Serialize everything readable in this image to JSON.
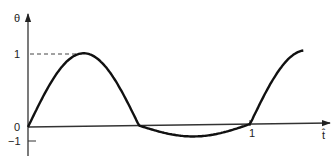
{
  "chart_data": {
    "type": "line",
    "title": "",
    "xlabel": "t̂",
    "ylabel": "θ",
    "x_ticks": [
      {
        "value": 1,
        "label": "1"
      }
    ],
    "y_ticks": [
      {
        "value": 1,
        "label": "1"
      },
      {
        "value": 0,
        "label": "0"
      },
      {
        "value": -1,
        "label": "−1"
      }
    ],
    "xlim": [
      0,
      1.2
    ],
    "ylim": [
      -1,
      1
    ],
    "grid": false,
    "legend": null,
    "annotations": [
      {
        "type": "dashed-reference-line",
        "y": 1,
        "from_x": 0,
        "to_x": 0.25
      }
    ],
    "series": [
      {
        "name": "theta",
        "function": "sin(2*pi*t)",
        "x": [
          0,
          0.05,
          0.1,
          0.15,
          0.2,
          0.25,
          0.3,
          0.35,
          0.4,
          0.45,
          0.5,
          0.55,
          0.6,
          0.65,
          0.7,
          0.75,
          0.8,
          0.85,
          0.9,
          0.95,
          1.0,
          1.05,
          1.1,
          1.15,
          1.2
        ],
        "values": [
          0,
          0.31,
          0.59,
          0.81,
          0.95,
          1.0,
          0.95,
          0.81,
          0.59,
          0.31,
          0,
          -0.31,
          -0.59,
          -0.81,
          -0.95,
          -1.0,
          -0.95,
          -0.81,
          -0.59,
          -0.31,
          0,
          0.31,
          0.59,
          0.81,
          0.95
        ]
      }
    ]
  },
  "labels": {
    "y_axis": "θ",
    "x_axis": "t̂",
    "y_tick_1": "1",
    "y_tick_0": "0",
    "y_tick_neg1": "−1",
    "x_tick_1": "1"
  }
}
